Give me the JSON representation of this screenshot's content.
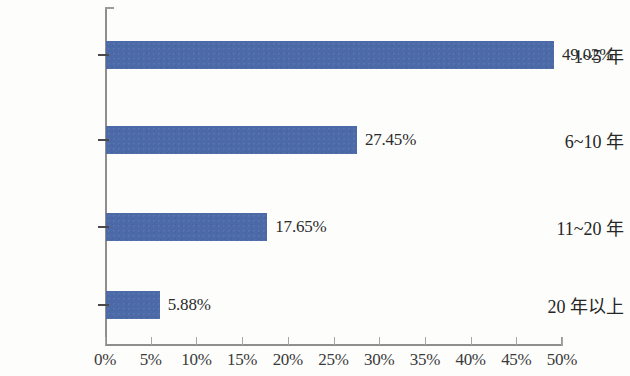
{
  "chart_data": {
    "type": "bar",
    "orientation": "horizontal",
    "title": "",
    "subtitle": "",
    "xlabel": "",
    "ylabel": "",
    "categories": [
      "1~5 年",
      "6~10 年",
      "11~20 年",
      "20 年以上"
    ],
    "values": [
      49.02,
      27.45,
      17.65,
      5.88
    ],
    "value_labels": [
      "49.02%",
      "27.45%",
      "17.65%",
      "5.88%"
    ],
    "xlim": [
      0,
      50
    ],
    "xtick_values": [
      0,
      5,
      10,
      15,
      20,
      25,
      30,
      35,
      40,
      45,
      50
    ],
    "xtick_labels": [
      "0%",
      "5%",
      "10%",
      "15%",
      "20%",
      "25%",
      "30%",
      "35%",
      "40%",
      "45%",
      "50%"
    ],
    "grid": false,
    "legend": false,
    "legend_position": "none",
    "series": [
      {
        "name": "",
        "values": [
          49.02,
          27.45,
          17.65,
          5.88
        ]
      }
    ],
    "colors": {
      "bar_fill": "#4d6aa8",
      "axis": "#8e8e8e",
      "tick": "#a6a6a6",
      "text": "#2b2b2b",
      "background": "#fdfdfc"
    }
  }
}
